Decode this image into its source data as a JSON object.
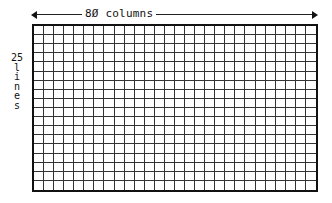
{
  "diagram": {
    "columns_label": "80 columns",
    "columns_label_display": "8Ø columns",
    "rows_label_number": "25",
    "rows_label_word": [
      "l",
      "i",
      "n",
      "e",
      "s"
    ],
    "grid": {
      "columns": 28,
      "rows": 18,
      "line_color": "#333333",
      "border_color": "#111111"
    },
    "arrow": {
      "direction": "both",
      "color": "#111111"
    }
  }
}
